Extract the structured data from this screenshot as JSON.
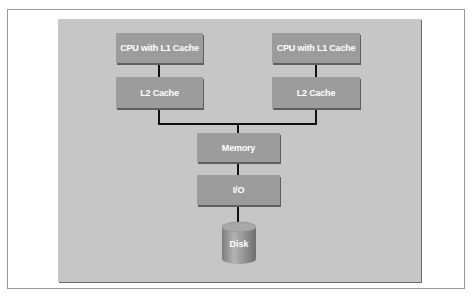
{
  "diagram": {
    "nodes": {
      "cpu_left": "CPU with L1 Cache",
      "l2_left": "L2 Cache",
      "cpu_right": "CPU with L1 Cache",
      "l2_right": "L2 Cache",
      "memory": "Memory",
      "io": "I/O",
      "disk": "Disk"
    },
    "edges": [
      [
        "cpu_left",
        "l2_left"
      ],
      [
        "cpu_right",
        "l2_right"
      ],
      [
        "l2_left",
        "memory"
      ],
      [
        "l2_right",
        "memory"
      ],
      [
        "memory",
        "io"
      ],
      [
        "io",
        "disk"
      ]
    ],
    "colors": {
      "panel": "#c6c6c6",
      "box": "#9c9c9c",
      "line": "#111111",
      "text": "#ffffff"
    }
  }
}
